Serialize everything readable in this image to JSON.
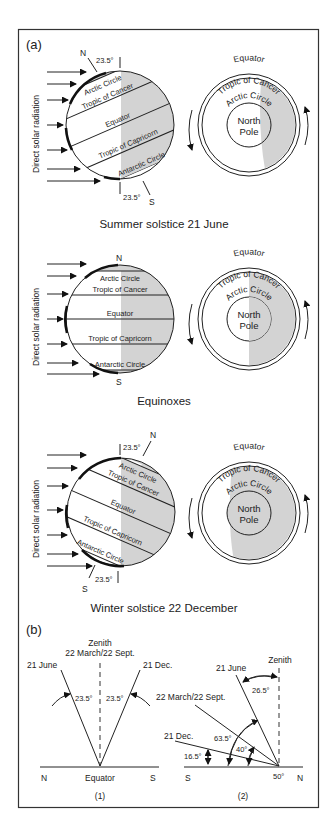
{
  "figure": {
    "panel_a_label": "(a)",
    "panel_b_label": "(b)",
    "colors": {
      "shading": "#d3d3d3",
      "lines": "#222222",
      "frame": "#333333",
      "background": "#ffffff"
    }
  },
  "summer": {
    "caption": "Summer solstice 21 June",
    "side_label": "Direct solar radiation",
    "north": "N",
    "south": "S",
    "tilt_top": "23.5°",
    "tilt_bottom": "23.5°",
    "bands": [
      "Arctic Circle",
      "Tropic of Cancer",
      "Equator",
      "Tropic of Capricorn",
      "Antarctic Circle"
    ],
    "polar": {
      "equator": "Equator",
      "tropic": "Tropic of Cancer",
      "arctic": "Arctic Circle",
      "pole_line1": "North",
      "pole_line2": "Pole"
    }
  },
  "equinox": {
    "caption": "Equinoxes",
    "side_label": "Direct solar radiation",
    "north": "N",
    "south": "S",
    "bands": [
      "Arctic Circle",
      "Tropic of Cancer",
      "Equator",
      "Tropic of Capricorn",
      "Antarctic Circle"
    ],
    "polar": {
      "equator": "Equator",
      "tropic": "Tropic of Cancer",
      "arctic": "Arctic Circle",
      "pole_line1": "North",
      "pole_line2": "Pole"
    }
  },
  "winter": {
    "caption": "Winter solstice 22 December",
    "side_label": "Direct solar radiation",
    "north": "N",
    "south": "S",
    "tilt_top": "23.5°",
    "tilt_bottom": "23.5°",
    "bands": [
      "Arctic Circle",
      "Tropic of Cancer",
      "Equator",
      "Tropic of Capricorn",
      "Antarctic Circle"
    ],
    "polar": {
      "equator": "Equator",
      "tropic": "Tropic of Cancer",
      "arctic": "Arctic Circle",
      "pole_line1": "North",
      "pole_line2": "Pole"
    }
  },
  "sun_angles_equator": {
    "zenith": "Zenith",
    "equinox": "22 March/22 Sept.",
    "june": "21 June",
    "dec": "21 Dec.",
    "angle_left": "23.5°",
    "angle_right": "23.5°",
    "north": "N",
    "south": "S",
    "base_label": "Equator",
    "sub_label": "(1)"
  },
  "sun_angles_50N": {
    "zenith": "Zenith",
    "june": "21 June",
    "equinox": "22 March/22 Sept.",
    "dec": "21 Dec.",
    "angle_zenith_june": "26.5°",
    "angle_june": "63.5°",
    "angle_equinox": "40°",
    "angle_dec": "16.5°",
    "latitude": "50°",
    "south": "S",
    "north": "N",
    "sub_label": "(2)"
  }
}
